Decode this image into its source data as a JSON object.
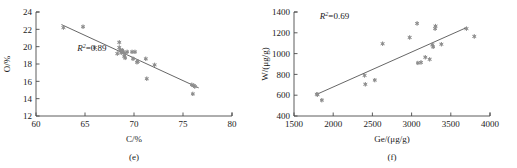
{
  "figure": {
    "marker_color": "#8d8d8d",
    "line_color": "#555555",
    "axis_color": "#4a4a4a",
    "background": "#ffffff"
  },
  "chart_data": [
    {
      "type": "scatter",
      "panel": "e",
      "caption": "(e)",
      "title": "",
      "xlabel": "C/%",
      "ylabel": "O/%",
      "xlim": [
        60,
        80
      ],
      "ylim": [
        12,
        24
      ],
      "xticks": [
        60,
        65,
        70,
        75,
        80
      ],
      "yticks": [
        12,
        14,
        16,
        18,
        20,
        22,
        24
      ],
      "xtick_labels": [
        "60",
        "65",
        "70",
        "75",
        "80"
      ],
      "ytick_labels": [
        "12",
        "14",
        "16",
        "18",
        "20",
        "22",
        "24"
      ],
      "grid": false,
      "legend": false,
      "annotations": [
        {
          "text_italic": "R",
          "text_sup": "2",
          "text_plain": "=0.89",
          "text": "R2=0.89",
          "x": 64.2,
          "y": 19.5
        }
      ],
      "r_squared": 0.89,
      "trendline": {
        "x": [
          62.6,
          76.6
        ],
        "y": [
          22.55,
          15.25
        ]
      },
      "points": [
        {
          "x": 62.8,
          "y": 22.2
        },
        {
          "x": 64.8,
          "y": 22.3
        },
        {
          "x": 66.0,
          "y": 19.9
        },
        {
          "x": 68.3,
          "y": 19.2
        },
        {
          "x": 68.5,
          "y": 20.5
        },
        {
          "x": 68.5,
          "y": 19.9
        },
        {
          "x": 68.6,
          "y": 19.6
        },
        {
          "x": 68.7,
          "y": 19.3
        },
        {
          "x": 68.8,
          "y": 19.6
        },
        {
          "x": 68.9,
          "y": 19.4
        },
        {
          "x": 69.0,
          "y": 18.9
        },
        {
          "x": 69.1,
          "y": 19.2
        },
        {
          "x": 69.1,
          "y": 18.7
        },
        {
          "x": 69.3,
          "y": 19.4
        },
        {
          "x": 69.8,
          "y": 19.4
        },
        {
          "x": 70.1,
          "y": 19.4
        },
        {
          "x": 69.9,
          "y": 18.6
        },
        {
          "x": 70.3,
          "y": 18.2
        },
        {
          "x": 70.4,
          "y": 18.3
        },
        {
          "x": 71.2,
          "y": 18.6
        },
        {
          "x": 71.3,
          "y": 16.3
        },
        {
          "x": 72.1,
          "y": 17.9
        },
        {
          "x": 75.9,
          "y": 15.6
        },
        {
          "x": 76.1,
          "y": 15.5
        },
        {
          "x": 76.2,
          "y": 15.4
        },
        {
          "x": 76.0,
          "y": 14.55
        }
      ]
    },
    {
      "type": "scatter",
      "panel": "f",
      "caption": "(f)",
      "title": "",
      "xlabel": "Ge/(μg/g)",
      "ylabel": "W/(μg/g)",
      "xlim": [
        1500,
        4000
      ],
      "ylim": [
        400,
        1400
      ],
      "xticks": [
        1500,
        2000,
        2500,
        3000,
        3500,
        4000
      ],
      "yticks": [
        400,
        600,
        800,
        1000,
        1200,
        1400
      ],
      "xtick_labels": [
        "1500",
        "2000",
        "2500",
        "3000",
        "3500",
        "4000"
      ],
      "ytick_labels": [
        "400",
        "600",
        "800",
        "1000",
        "1200",
        "1400"
      ],
      "grid": false,
      "legend": false,
      "annotations": [
        {
          "text_italic": "R",
          "text_sup": "2",
          "text_plain": "=0.69",
          "text": "R2=0.69",
          "x": 1830,
          "y": 1330
        }
      ],
      "r_squared": 0.69,
      "trendline": {
        "x": [
          1780,
          3700
        ],
        "y": [
          605,
          1250
        ]
      },
      "points": [
        {
          "x": 1790,
          "y": 610
        },
        {
          "x": 1800,
          "y": 605
        },
        {
          "x": 1855,
          "y": 552
        },
        {
          "x": 2400,
          "y": 790
        },
        {
          "x": 2410,
          "y": 705
        },
        {
          "x": 2530,
          "y": 745
        },
        {
          "x": 2630,
          "y": 1095
        },
        {
          "x": 2975,
          "y": 1155
        },
        {
          "x": 3070,
          "y": 1290
        },
        {
          "x": 3080,
          "y": 910
        },
        {
          "x": 3120,
          "y": 915
        },
        {
          "x": 3175,
          "y": 965
        },
        {
          "x": 3230,
          "y": 945
        },
        {
          "x": 3265,
          "y": 1085
        },
        {
          "x": 3275,
          "y": 1065
        },
        {
          "x": 3300,
          "y": 1240
        },
        {
          "x": 3305,
          "y": 1265
        },
        {
          "x": 3380,
          "y": 1090
        },
        {
          "x": 3700,
          "y": 1240
        },
        {
          "x": 3800,
          "y": 1165
        }
      ]
    }
  ]
}
